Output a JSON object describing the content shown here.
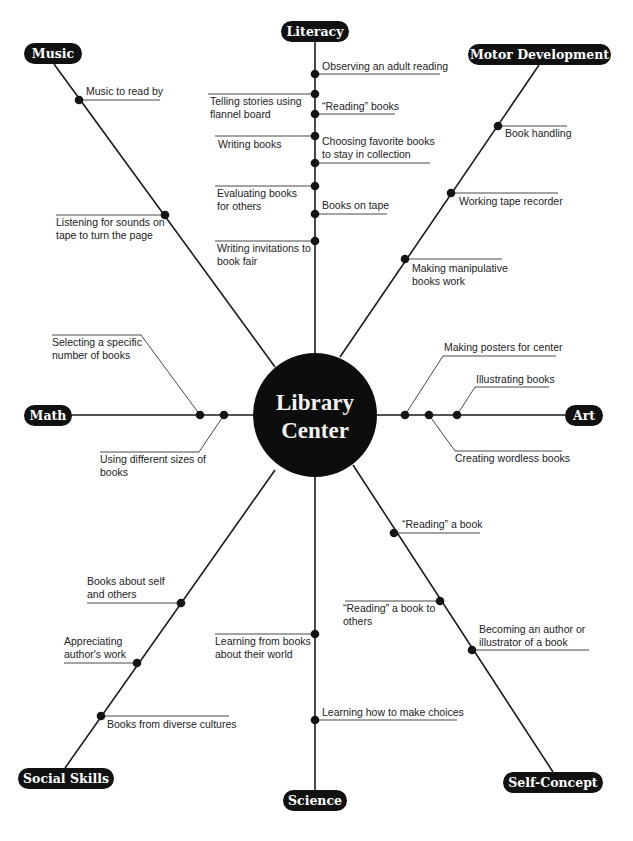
{
  "title": "Library Center",
  "center": {
    "label_line1": "Library",
    "label_line2": "Center",
    "x": 315,
    "y": 415,
    "r": 62
  },
  "colors": {
    "ink": "#111111",
    "text": "#222222",
    "background": "#ffffff"
  },
  "categories": [
    {
      "id": "literacy",
      "label": "Literacy",
      "pill": {
        "x": 281,
        "y": 21,
        "w": 68,
        "h": 21
      },
      "spoke": [
        315,
        42,
        315,
        353
      ]
    },
    {
      "id": "music",
      "label": "Music",
      "pill": {
        "x": 24,
        "y": 43,
        "w": 58,
        "h": 21
      },
      "spoke": [
        54,
        64,
        275,
        367
      ]
    },
    {
      "id": "motor-development",
      "label": "Motor Development",
      "pill": {
        "x": 468,
        "y": 44,
        "w": 143,
        "h": 21
      },
      "spoke": [
        539,
        65,
        340,
        357
      ]
    },
    {
      "id": "math",
      "label": "Math",
      "pill": {
        "x": 24,
        "y": 405,
        "w": 48,
        "h": 21
      },
      "spoke": [
        72,
        415,
        253,
        415
      ]
    },
    {
      "id": "art",
      "label": "Art",
      "pill": {
        "x": 565,
        "y": 405,
        "w": 38,
        "h": 21
      },
      "spoke": [
        377,
        415,
        565,
        415
      ]
    },
    {
      "id": "social-skills",
      "label": "Social Skills",
      "pill": {
        "x": 18,
        "y": 768,
        "w": 96,
        "h": 21
      },
      "spoke": [
        65,
        768,
        275,
        470
      ]
    },
    {
      "id": "science",
      "label": "Science",
      "pill": {
        "x": 283,
        "y": 790,
        "w": 64,
        "h": 21
      },
      "spoke": [
        315,
        477,
        315,
        790
      ]
    },
    {
      "id": "self-concept",
      "label": "Self-Concept",
      "pill": {
        "x": 503,
        "y": 772,
        "w": 100,
        "h": 21
      },
      "spoke": [
        353,
        465,
        553,
        772
      ]
    }
  ],
  "activities": [
    {
      "category": "literacy",
      "lines": [
        "Observing an adult reading"
      ],
      "dot": [
        315,
        74
      ],
      "leader": [
        315,
        74,
        440,
        74
      ],
      "text": [
        322,
        70
      ],
      "anchor": "start"
    },
    {
      "category": "literacy",
      "lines": [
        "Telling stories using",
        "flannel board"
      ],
      "dot": [
        315,
        94
      ],
      "leader": [
        208,
        94,
        315,
        94
      ],
      "text": [
        210,
        105
      ],
      "anchor": "start"
    },
    {
      "category": "literacy",
      "lines": [
        "“Reading” books"
      ],
      "dot": [
        315,
        114
      ],
      "leader": [
        315,
        114,
        395,
        114
      ],
      "text": [
        322,
        110
      ],
      "anchor": "start"
    },
    {
      "category": "literacy",
      "lines": [
        "Writing books"
      ],
      "dot": [
        315,
        136
      ],
      "leader": [
        215,
        136,
        315,
        136
      ],
      "text": [
        218,
        148
      ],
      "anchor": "start"
    },
    {
      "category": "literacy",
      "lines": [
        "Choosing favorite books",
        "to stay in collection"
      ],
      "dot": [
        315,
        163
      ],
      "leader": [
        315,
        163,
        430,
        163
      ],
      "text": [
        322,
        145
      ],
      "anchor": "start"
    },
    {
      "category": "literacy",
      "lines": [
        "Evaluating books",
        "for others"
      ],
      "dot": [
        315,
        186
      ],
      "leader": [
        215,
        186,
        315,
        186
      ],
      "text": [
        217,
        197
      ],
      "anchor": "start"
    },
    {
      "category": "literacy",
      "lines": [
        "Books on tape"
      ],
      "dot": [
        315,
        214
      ],
      "leader": [
        315,
        214,
        387,
        214
      ],
      "text": [
        322,
        209
      ],
      "anchor": "start"
    },
    {
      "category": "literacy",
      "lines": [
        "Writing invitations to",
        "book fair"
      ],
      "dot": [
        315,
        241
      ],
      "leader": [
        215,
        241,
        315,
        241
      ],
      "text": [
        217,
        252
      ],
      "anchor": "start"
    },
    {
      "category": "music",
      "lines": [
        "Music to read by"
      ],
      "dot": [
        79,
        100
      ],
      "leader": [
        79,
        100,
        160,
        100
      ],
      "text": [
        86,
        95
      ],
      "anchor": "start"
    },
    {
      "category": "music",
      "lines": [
        "Listening for sounds on",
        "tape to turn the page"
      ],
      "dot": [
        165,
        215
      ],
      "leader": [
        56,
        215,
        165,
        215
      ],
      "text": [
        56,
        226
      ],
      "anchor": "start"
    },
    {
      "category": "motor-development",
      "lines": [
        "Book handling"
      ],
      "dot": [
        498,
        126
      ],
      "leader": [
        498,
        126,
        567,
        126
      ],
      "text": [
        505,
        137
      ],
      "anchor": "start"
    },
    {
      "category": "motor-development",
      "lines": [
        "Working tape recorder"
      ],
      "dot": [
        451,
        193
      ],
      "leader": [
        451,
        193,
        558,
        193
      ],
      "text": [
        459,
        205
      ],
      "anchor": "start"
    },
    {
      "category": "motor-development",
      "lines": [
        "Making manipulative",
        "books work"
      ],
      "dot": [
        405,
        259
      ],
      "leader": [
        405,
        259,
        502,
        259
      ],
      "text": [
        412,
        272
      ],
      "anchor": "start"
    },
    {
      "category": "math",
      "lines": [
        "Selecting a specific",
        "number of books"
      ],
      "dot": [
        200,
        415
      ],
      "leader": [
        52,
        335,
        141,
        335,
        200,
        415
      ],
      "text": [
        52,
        346
      ],
      "anchor": "start"
    },
    {
      "category": "math",
      "lines": [
        "Using different sizes of",
        "books"
      ],
      "dot": [
        224,
        415
      ],
      "leader": [
        224,
        415,
        199,
        452,
        100,
        452
      ],
      "text": [
        100,
        463
      ],
      "anchor": "start"
    },
    {
      "category": "art",
      "lines": [
        "Making posters for center"
      ],
      "dot": [
        405,
        415
      ],
      "leader": [
        405,
        415,
        443,
        356,
        556,
        356
      ],
      "text": [
        444,
        351
      ],
      "anchor": "start"
    },
    {
      "category": "art",
      "lines": [
        "Creating wordless books"
      ],
      "dot": [
        429,
        415
      ],
      "leader": [
        429,
        415,
        455,
        451,
        562,
        451
      ],
      "text": [
        455,
        462
      ],
      "anchor": "start"
    },
    {
      "category": "art",
      "lines": [
        "Illustrating books"
      ],
      "dot": [
        457,
        415
      ],
      "leader": [
        457,
        415,
        475,
        387,
        549,
        387
      ],
      "text": [
        476,
        383
      ],
      "anchor": "start"
    },
    {
      "category": "social-skills",
      "lines": [
        "Books about self",
        "and others"
      ],
      "dot": [
        181,
        603
      ],
      "leader": [
        87,
        603,
        181,
        603
      ],
      "text": [
        87,
        585
      ],
      "anchor": "start"
    },
    {
      "category": "social-skills",
      "lines": [
        "Appreciating",
        "author's work"
      ],
      "dot": [
        137,
        663
      ],
      "leader": [
        64,
        663,
        137,
        663
      ],
      "text": [
        64,
        645
      ],
      "anchor": "start"
    },
    {
      "category": "social-skills",
      "lines": [
        "Books from diverse cultures"
      ],
      "dot": [
        101,
        716
      ],
      "leader": [
        101,
        716,
        229,
        716
      ],
      "text": [
        107,
        728
      ],
      "anchor": "start"
    },
    {
      "category": "science",
      "lines": [
        "Learning from books",
        "about their world"
      ],
      "dot": [
        315,
        634
      ],
      "leader": [
        215,
        634,
        315,
        634
      ],
      "text": [
        215,
        645
      ],
      "anchor": "start"
    },
    {
      "category": "science",
      "lines": [
        "Learning how to make choices"
      ],
      "dot": [
        315,
        720
      ],
      "leader": [
        315,
        720,
        457,
        720
      ],
      "text": [
        322,
        716
      ],
      "anchor": "start"
    },
    {
      "category": "self-concept",
      "lines": [
        "“Reading” a book"
      ],
      "dot": [
        394,
        533
      ],
      "leader": [
        394,
        533,
        480,
        533
      ],
      "text": [
        402,
        528
      ],
      "anchor": "start"
    },
    {
      "category": "self-concept",
      "lines": [
        "“Reading” a book to",
        "others"
      ],
      "dot": [
        440,
        601
      ],
      "leader": [
        345,
        601,
        440,
        601
      ],
      "text": [
        343,
        612
      ],
      "anchor": "start"
    },
    {
      "category": "self-concept",
      "lines": [
        "Becoming an author or",
        "illustrator of a book"
      ],
      "dot": [
        472,
        650
      ],
      "leader": [
        472,
        650,
        589,
        650
      ],
      "text": [
        479,
        633
      ],
      "anchor": "start"
    }
  ]
}
